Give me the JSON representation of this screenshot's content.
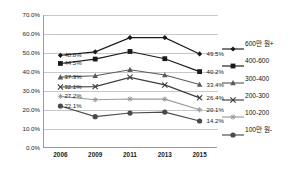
{
  "chart_data": {
    "type": "line",
    "title": "",
    "xlabel": "",
    "ylabel": "",
    "categories": [
      "2006",
      "2009",
      "2011",
      "2013",
      "2015"
    ],
    "ylim": [
      0,
      70
    ],
    "ytick_labels": [
      "0.0%",
      "10.0%",
      "20.0%",
      "30.0%",
      "40.0%",
      "50.0%",
      "60.0%",
      "70.0%"
    ],
    "ytick_values": [
      0,
      10,
      20,
      30,
      40,
      50,
      60,
      70
    ],
    "grid": true,
    "legend_position": "right",
    "series": [
      {
        "name": "600만 원+",
        "marker": "diamond",
        "color": "#1a1a1a",
        "values": [
          48.8,
          50.6,
          58.1,
          58.1,
          49.5
        ],
        "start_label": "48.8%",
        "end_label": "49.5%"
      },
      {
        "name": "400-600",
        "marker": "square",
        "color": "#1a1a1a",
        "values": [
          44.5,
          46.8,
          50.8,
          47.0,
          40.2
        ],
        "start_label": "44.5%",
        "end_label": "40.2%"
      },
      {
        "name": "300-400",
        "marker": "triangle",
        "color": "#5a5a5a",
        "values": [
          37.3,
          38.0,
          41.2,
          38.4,
          33.4
        ],
        "start_label": "37.3%",
        "end_label": "33.4%"
      },
      {
        "name": "200-300",
        "marker": "cross",
        "color": "#3d3d3d",
        "values": [
          32.1,
          32.3,
          37.2,
          33.2,
          26.4
        ],
        "start_label": "32.1%",
        "end_label": "26.4%"
      },
      {
        "name": "100-200",
        "marker": "star",
        "color": "#9a9a9a",
        "values": [
          27.2,
          25.4,
          25.8,
          25.7,
          20.1
        ],
        "start_label": "27.2%",
        "end_label": "20.1%"
      },
      {
        "name": "100만 원-",
        "marker": "circle",
        "color": "#4a4a4a",
        "values": [
          22.1,
          16.5,
          18.4,
          18.9,
          14.2
        ],
        "start_label": "22.1%",
        "end_label": "14.2%"
      }
    ]
  }
}
